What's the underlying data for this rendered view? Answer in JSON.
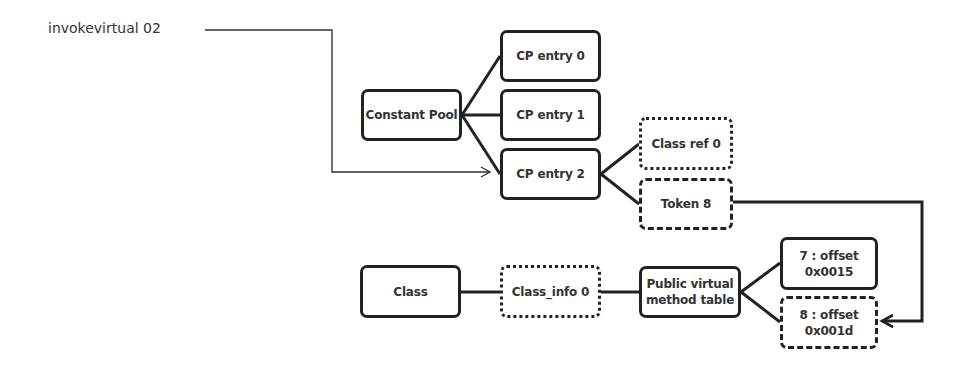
{
  "diagram": {
    "instruction_label": "invokevirtual 02",
    "nodes": {
      "constant_pool": {
        "label": "Constant Pool",
        "style": "solid"
      },
      "cp_entry_0": {
        "label": "CP entry 0",
        "style": "solid"
      },
      "cp_entry_1": {
        "label": "CP entry 1",
        "style": "solid"
      },
      "cp_entry_2": {
        "label": "CP entry 2",
        "style": "solid"
      },
      "class_ref_0": {
        "label": "Class ref 0",
        "style": "dotted"
      },
      "token_8": {
        "label": "Token 8",
        "style": "dashed"
      },
      "class": {
        "label": "Class",
        "style": "solid"
      },
      "class_info_0": {
        "label": "Class_info 0",
        "style": "dotted"
      },
      "pvmt": {
        "line1": "Public virtual",
        "line2": "method table",
        "style": "solid"
      },
      "offset_7": {
        "line1": "7 :  offset",
        "line2": "0x0015",
        "style": "solid"
      },
      "offset_8": {
        "line1": "8 : offset",
        "line2": "0x001d",
        "style": "dashed"
      }
    },
    "edges": [
      {
        "from": "invokevirtual 02",
        "to": "cp_entry_2",
        "type": "arrow"
      },
      {
        "from": "constant_pool",
        "to": "cp_entry_0",
        "type": "line"
      },
      {
        "from": "constant_pool",
        "to": "cp_entry_1",
        "type": "line"
      },
      {
        "from": "constant_pool",
        "to": "cp_entry_2",
        "type": "line"
      },
      {
        "from": "cp_entry_2",
        "to": "class_ref_0",
        "type": "line"
      },
      {
        "from": "cp_entry_2",
        "to": "token_8",
        "type": "line"
      },
      {
        "from": "token_8",
        "to": "offset_8",
        "type": "arrow"
      },
      {
        "from": "class",
        "to": "class_info_0",
        "type": "line"
      },
      {
        "from": "class_info_0",
        "to": "pvmt",
        "type": "line"
      },
      {
        "from": "pvmt",
        "to": "offset_7",
        "type": "line"
      },
      {
        "from": "pvmt",
        "to": "offset_8",
        "type": "line"
      }
    ],
    "colors": {
      "stroke": "#222222",
      "background": "#ffffff",
      "text": "#333333"
    }
  }
}
